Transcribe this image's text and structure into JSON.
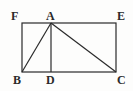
{
  "figure": {
    "background_color": "#fdfdfc",
    "stroke_color": "#2a2a2a",
    "label_color": "#2a2a2a",
    "stroke_width": 1.2,
    "width": 133,
    "height": 91
  },
  "points": {
    "F": {
      "label": "F",
      "x": 22,
      "y": 23,
      "label_x": 11,
      "label_y": 10
    },
    "A": {
      "label": "A",
      "x": 51,
      "y": 23,
      "label_x": 46,
      "label_y": 10
    },
    "E": {
      "label": "E",
      "x": 116,
      "y": 23,
      "label_x": 117,
      "label_y": 10
    },
    "B": {
      "label": "B",
      "x": 22,
      "y": 72,
      "label_x": 13,
      "label_y": 74
    },
    "D": {
      "label": "D",
      "x": 51,
      "y": 72,
      "label_x": 46,
      "label_y": 74
    },
    "C": {
      "label": "C",
      "x": 116,
      "y": 72,
      "label_x": 117,
      "label_y": 74
    }
  },
  "shapes": {
    "rectangle": {
      "name": "FBCE",
      "x": 22,
      "y": 23,
      "width": 94,
      "height": 49
    },
    "segments": [
      {
        "name": "AB",
        "x1": 51,
        "y1": 23,
        "x2": 22,
        "y2": 72
      },
      {
        "name": "AD",
        "x1": 51,
        "y1": 23,
        "x2": 51,
        "y2": 72
      },
      {
        "name": "AC",
        "x1": 51,
        "y1": 23,
        "x2": 116,
        "y2": 72
      }
    ]
  }
}
